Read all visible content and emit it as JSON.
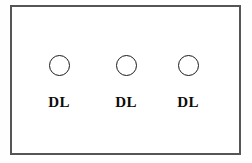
{
  "diagram": {
    "frame": {
      "name": "panel-border",
      "border_color": "#555555",
      "fill_color": "#ffffff"
    },
    "background_color": "#fefefe",
    "nodes": [
      {
        "id": "node-1",
        "label": "DL",
        "shape": "circle",
        "x": 59,
        "stroke_color": "#1a1a1a",
        "fill_color": "#ffffff"
      },
      {
        "id": "node-2",
        "label": "DL",
        "shape": "circle",
        "x": 126,
        "stroke_color": "#1a1a1a",
        "fill_color": "#ffffff"
      },
      {
        "id": "node-3",
        "label": "DL",
        "shape": "circle",
        "x": 188,
        "stroke_color": "#1a1a1a",
        "fill_color": "#ffffff"
      }
    ]
  }
}
